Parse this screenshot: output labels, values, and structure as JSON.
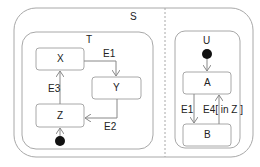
{
  "diagram": {
    "type": "UML state machine",
    "states": {
      "S": {
        "label": "S"
      },
      "T": {
        "label": "T"
      },
      "U": {
        "label": "U"
      },
      "X": {
        "label": "X"
      },
      "Y": {
        "label": "Y"
      },
      "Z": {
        "label": "Z"
      },
      "A": {
        "label": "A"
      },
      "B": {
        "label": "B"
      }
    },
    "transitions": {
      "x_to_y": {
        "label": "E1"
      },
      "y_to_z": {
        "label": "E2"
      },
      "z_to_x": {
        "label": "E3"
      },
      "a_to_b": {
        "label": "E1"
      },
      "b_to_a": {
        "label": "E4[ in Z ]"
      }
    },
    "colors": {
      "border": "#9a9a9a",
      "line": "#888888",
      "initial": "#111111"
    }
  }
}
